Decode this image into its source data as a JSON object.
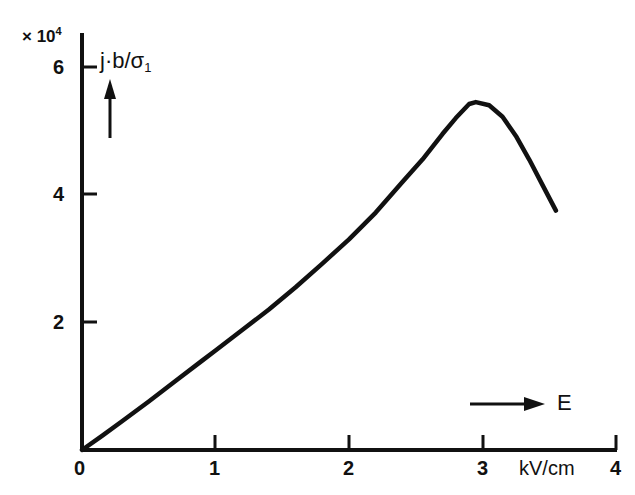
{
  "figure": {
    "background_color": "#ffffff",
    "ink_color": "#111111",
    "y_axis_multiplier": "× 10",
    "y_axis_exponent": "4",
    "y_axis_title": "j·b/σ",
    "y_axis_title_subscript": "1",
    "x_axis_unit": "kV/cm",
    "x_axis_symbol": "E",
    "y_arrow_icon": "up-arrow-icon",
    "x_arrow_icon": "right-arrow-icon"
  },
  "chart_data": {
    "type": "line",
    "title": "",
    "subtitle": "",
    "xlabel": "E",
    "x_unit": "kV/cm",
    "ylabel": "j·b/σ₁",
    "y_multiplier": 10000,
    "y_multiplier_text": "× 10⁴",
    "xlim": [
      0,
      4
    ],
    "ylim": [
      0,
      6.4
    ],
    "xticks": [
      0,
      1,
      2,
      3,
      4
    ],
    "xtick_labels": [
      "0",
      "1",
      "2",
      "3",
      "4"
    ],
    "yticks": [
      0,
      2,
      4,
      6
    ],
    "ytick_labels": [
      "0",
      "2",
      "4",
      "6"
    ],
    "grid": false,
    "legend": null,
    "axis_style": "L-shaped (left and bottom spines only)",
    "series": [
      {
        "name": "j·b/σ₁ vs E",
        "x": [
          0.0,
          0.15,
          0.3,
          0.5,
          0.7,
          0.9,
          1.0,
          1.2,
          1.4,
          1.6,
          1.8,
          2.0,
          2.2,
          2.4,
          2.55,
          2.7,
          2.8,
          2.9,
          2.95,
          3.05,
          3.15,
          3.25,
          3.35,
          3.45,
          3.55
        ],
        "y": [
          0.0,
          0.22,
          0.45,
          0.76,
          1.08,
          1.4,
          1.56,
          1.88,
          2.2,
          2.55,
          2.92,
          3.3,
          3.72,
          4.2,
          4.55,
          4.95,
          5.2,
          5.42,
          5.45,
          5.4,
          5.22,
          4.92,
          4.55,
          4.15,
          3.75
        ]
      }
    ],
    "annotations": [
      {
        "text": "× 10⁴",
        "x_px": 22,
        "y_px": 30,
        "role": "y-axis-multiplier"
      },
      {
        "text": "j·b/σ₁",
        "x_px": 104,
        "y_px": 52,
        "role": "y-axis-title"
      },
      {
        "text": "E",
        "x_px": 560,
        "y_px": 392,
        "role": "x-axis-symbol"
      },
      {
        "text": "kV/cm",
        "x_px": 492,
        "y_px": 458,
        "role": "x-axis-unit"
      }
    ],
    "peak": {
      "x": 2.95,
      "y": 5.45
    },
    "endpoint": {
      "x": 3.55,
      "y": 3.75
    }
  }
}
